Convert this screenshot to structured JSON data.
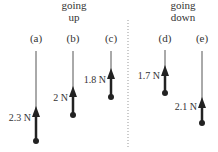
{
  "headers": {
    "up": {
      "line1": "going",
      "line2": "up"
    },
    "down": {
      "line1": "going",
      "line2": "down"
    }
  },
  "cases": [
    {
      "id": "a",
      "label": "(a)",
      "force": "2.3 N"
    },
    {
      "id": "b",
      "label": "(b)",
      "force": "2 N"
    },
    {
      "id": "c",
      "label": "(c)",
      "force": "1.8 N"
    },
    {
      "id": "d",
      "label": "(d)",
      "force": "1.7 N"
    },
    {
      "id": "e",
      "label": "(e)",
      "force": "2.1 N"
    }
  ],
  "colors": {
    "ink": "#222222",
    "thread": "#555555",
    "divider": "#999999"
  }
}
